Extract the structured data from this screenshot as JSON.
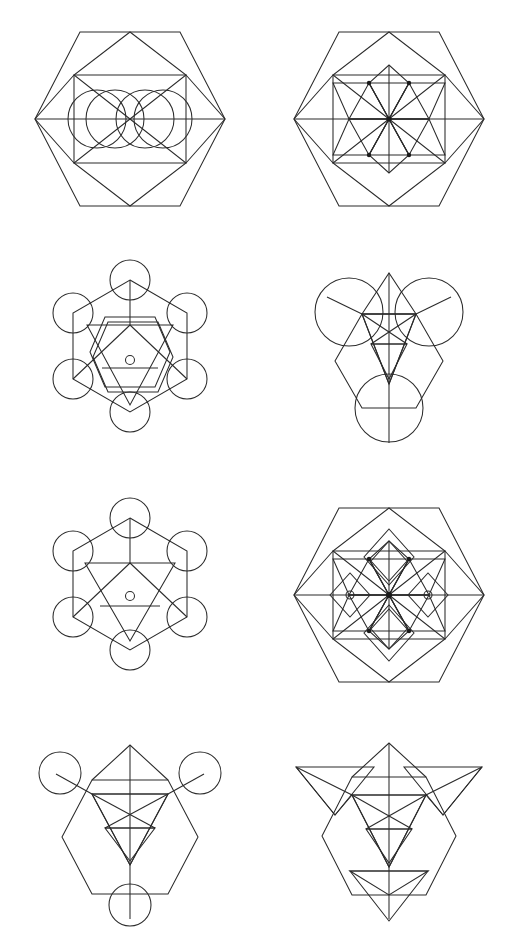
{
  "page": {
    "background_color": "#ffffff",
    "stroke_color": "#2b2b2b",
    "width": 519,
    "height": 952,
    "columns": 2,
    "rows": 4,
    "figure_count": 8
  },
  "figures": [
    {
      "id": "figure-1",
      "position": "row-1-col-1",
      "name": "hexagon-with-four-circles",
      "description": "Large regular hexagon containing an inscribed inner hexagon, upper and lower rhombi, a horizontal center axis, and four equal circles arranged in two overlapping pairs on the center axis",
      "shapes": [
        "outer-hexagon",
        "inner-hexagon",
        "top-rhombus",
        "bottom-rhombus",
        "horizontal-axis",
        "circle-1",
        "circle-2",
        "circle-3",
        "circle-4"
      ],
      "circle_count": 4,
      "has_center_dot": false
    },
    {
      "id": "figure-2",
      "position": "row-1-col-2",
      "name": "nested-hexagon-star-rosette",
      "description": "Large regular hexagon with inscribed hexagon and rhombi, enclosing a small central hexagon filled with a six-pointed rosette of rhombi and radial spokes with vertex dots",
      "shapes": [
        "outer-hexagon",
        "inner-hexagon",
        "top-rhombus",
        "bottom-rhombus",
        "center-hexagon",
        "rosette-rhombi",
        "radial-spokes",
        "vertex-dots"
      ],
      "circle_count": 0,
      "has_center_dot": true
    },
    {
      "id": "figure-3",
      "position": "row-2-col-1",
      "name": "hexagram-hexagon-six-circles",
      "description": "Hexagon with six circles at its vertices, a vertical stem from the top, an inner rotated hexagon, a large downward triangle, an upward triangle and a small circle at centre",
      "shapes": [
        "outer-hexagon",
        "vertex-circles",
        "vertical-stem",
        "inner-rotated-hexagon",
        "down-triangle",
        "up-triangle",
        "center-small-circle"
      ],
      "circle_count": 6,
      "has_center_dot": false
    },
    {
      "id": "figure-4",
      "position": "row-2-col-2",
      "name": "metatron-three-large-circles",
      "description": "Hexagon with a peaked top, three large circles at upper-left, upper-right and bottom, nested downward triangles, radial spokes and a horizontal chord",
      "shapes": [
        "hexagon",
        "peak-lines",
        "circle-upper-left",
        "circle-upper-right",
        "circle-bottom",
        "down-triangle-outer",
        "down-triangle-inner",
        "radial-spokes",
        "horizontal-chord"
      ],
      "circle_count": 3,
      "has_center_dot": false
    },
    {
      "id": "figure-5",
      "position": "row-3-col-1",
      "name": "hexagon-six-circles-single-triangle",
      "description": "Hexagon with six circles at its vertices, vertical stem from the top vertex, a single large downward triangle, a horizontal chord and a small circle at centre",
      "shapes": [
        "outer-hexagon",
        "vertex-circles",
        "vertical-stem",
        "down-triangle",
        "horizontal-chord",
        "center-small-circle"
      ],
      "circle_count": 6,
      "has_center_dot": false
    },
    {
      "id": "figure-6",
      "position": "row-3-col-2",
      "name": "hexagon-rosette-with-outer-diamonds",
      "description": "Large hexagon with inscribed hexagon and rhombi, a central six-point rosette of rhombi with radial spokes and vertex dots, plus four outer diamonds on the vertical and horizontal axes",
      "shapes": [
        "outer-hexagon",
        "inner-hexagon",
        "top-rhombus",
        "bottom-rhombus",
        "center-hexagon",
        "rosette-rhombi",
        "radial-spokes",
        "vertex-dots",
        "outer-diamonds"
      ],
      "circle_count": 0,
      "has_center_dot": true
    },
    {
      "id": "figure-7",
      "position": "row-4-col-1",
      "name": "metatron-three-small-circles",
      "description": "Hexagon with a peaked top, three small circles at upper-left, upper-right and bottom ends of radial stems, nested downward triangles, radial spokes and a horizontal chord",
      "shapes": [
        "hexagon",
        "peak-lines",
        "circle-upper-left",
        "circle-upper-right",
        "circle-bottom",
        "down-triangle-outer",
        "down-triangle-inner",
        "radial-spokes",
        "horizontal-chord"
      ],
      "circle_count": 3,
      "has_center_dot": false
    },
    {
      "id": "figure-8",
      "position": "row-4-col-2",
      "name": "metatron-three-triangles",
      "description": "Hexagon with a peaked top where the three circles are replaced by three downward triangles at upper-left, upper-right and bottom, with nested downward triangles and radial spokes inside",
      "shapes": [
        "hexagon",
        "peak-lines",
        "triangle-upper-left",
        "triangle-upper-right",
        "triangle-bottom",
        "down-triangle-outer",
        "down-triangle-inner",
        "radial-spokes",
        "horizontal-chord"
      ],
      "circle_count": 0,
      "has_center_dot": false
    }
  ]
}
